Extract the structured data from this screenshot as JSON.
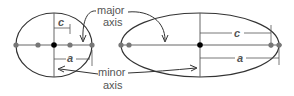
{
  "labels": {
    "major_line1": "major",
    "major_line2": "axis",
    "minor_line1": "minor",
    "minor_line2": "axis",
    "left_c": "c",
    "left_a": "a",
    "right_c": "c",
    "right_a": "a"
  },
  "colors": {
    "stroke": "#333333",
    "center_point": "#000000",
    "focus_point": "#777777",
    "text": "#555555"
  },
  "ellipses": [
    {
      "name": "circular-ellipse",
      "cx": 54,
      "cy": 45,
      "rx": 38,
      "ry": 32
    },
    {
      "name": "elongated-ellipse",
      "cx": 200,
      "cy": 45,
      "rx": 79,
      "ry": 32
    }
  ]
}
